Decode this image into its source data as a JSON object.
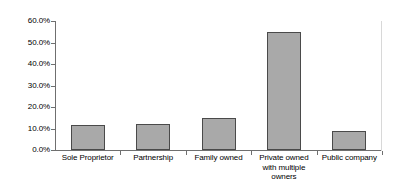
{
  "chart_data": {
    "type": "bar",
    "title": "",
    "subtitle": "",
    "xlabel": "",
    "ylabel": "",
    "categories": [
      "Sole Proprietor",
      "Partnership",
      "Family owned",
      "Private owned with multiple owners",
      "Public company"
    ],
    "values": [
      11.5,
      12.0,
      15.0,
      55.0,
      9.0
    ],
    "value_labels": [
      "11.5%",
      "12.0%",
      "15.0%",
      "55.0%",
      "9.0%"
    ],
    "ylim": [
      0,
      60
    ],
    "ytick_values": [
      0,
      10,
      20,
      30,
      40,
      50,
      60
    ],
    "ytick_labels": [
      "0.0%",
      "10.0%",
      "20.0%",
      "30.0%",
      "40.0%",
      "50.0%",
      "60.0%"
    ],
    "grid": false,
    "legend": false,
    "legend_position": "none",
    "bar_color": "#a9a9a9",
    "bar_border_color": "#4a4a4a",
    "axis_color": "#6f6f6f",
    "background_color": "#ffffff"
  },
  "category_lines": [
    [
      "Sole Proprietor"
    ],
    [
      "Partnership"
    ],
    [
      "Family owned"
    ],
    [
      "Private owned",
      "with multiple",
      "owners"
    ],
    [
      "Public company"
    ]
  ]
}
